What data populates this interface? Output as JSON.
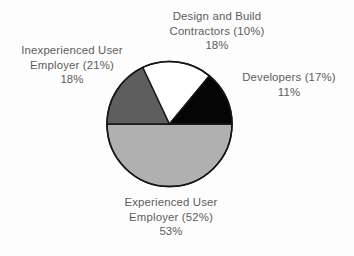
{
  "chart_data": {
    "type": "pie",
    "title": "",
    "subtitle": "",
    "xlabel": "",
    "ylabel": "",
    "legend_position": "none",
    "grid": false,
    "start_angle_deg": 270,
    "direction": "clockwise",
    "categories": [
      "Inexperienced User Employer",
      "Design and Build Contractors",
      "Developers",
      "Experienced User Employer"
    ],
    "values": [
      18,
      18,
      11,
      53
    ],
    "value_unit": "%",
    "slices": [
      {
        "name": "Inexperienced User Employer",
        "label_lines": [
          "Inexperienced User",
          "Employer (21%)"
        ],
        "label_value": "18%",
        "value": 18,
        "reference_value": 21,
        "color": "#5e5e5e",
        "start_deg": 270,
        "end_deg": 334.8
      },
      {
        "name": "Design and Build Contractors",
        "label_lines": [
          "Design and Build",
          "Contractors (10%)"
        ],
        "label_value": "18%",
        "value": 18,
        "reference_value": 10,
        "color": "#ffffff",
        "start_deg": 334.8,
        "end_deg": 39.6
      },
      {
        "name": "Developers",
        "label_lines": [
          "Developers (17%)"
        ],
        "label_value": "11%",
        "value": 11,
        "reference_value": 17,
        "color": "#050505",
        "start_deg": 39.6,
        "end_deg": 90
      },
      {
        "name": "Experienced User Employer",
        "label_lines": [
          "Experienced User",
          "Employer (52%)"
        ],
        "label_value": "53%",
        "value": 53,
        "reference_value": 52,
        "color": "#b0b0b0",
        "start_deg": 90,
        "end_deg": 270
      }
    ]
  },
  "labels": {
    "contractors": {
      "line1": "Design and Build",
      "line2": "Contractors (10%)",
      "value": "18%"
    },
    "inexperienced": {
      "line1": "Inexperienced User",
      "line2": "Employer (21%)",
      "value": "18%"
    },
    "developers": {
      "line1": "Developers (17%)",
      "value": "11%"
    },
    "experienced": {
      "line1": "Experienced User",
      "line2": "Employer (52%)",
      "value": "53%"
    }
  },
  "colors": {
    "background": "#fdfdfd",
    "text": "#5c5c5c",
    "outline": "#151515",
    "slice_dark_gray": "#5e5e5e",
    "slice_white": "#ffffff",
    "slice_black": "#050505",
    "slice_light_gray": "#b0b0b0"
  }
}
